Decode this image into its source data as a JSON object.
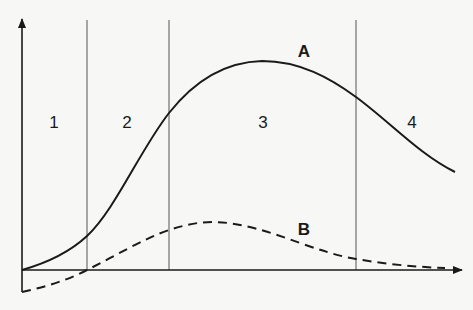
{
  "diagram": {
    "regions": [
      {
        "id": "1",
        "label": "1"
      },
      {
        "id": "2",
        "label": "2"
      },
      {
        "id": "3",
        "label": "3"
      },
      {
        "id": "4",
        "label": "4"
      }
    ],
    "curves": [
      {
        "id": "A",
        "label": "A",
        "style": "solid"
      },
      {
        "id": "B",
        "label": "B",
        "style": "dashed"
      }
    ],
    "colors": {
      "ink": "#1a1a1a",
      "divider": "#555555",
      "background": "#f7f7f5"
    }
  }
}
